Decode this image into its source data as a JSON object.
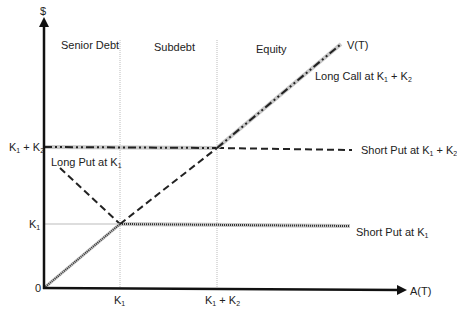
{
  "axes": {
    "y_label": "$",
    "x_label": "A(T)",
    "origin_label": "0",
    "x_ticks": [
      {
        "base": "K",
        "sub": "1",
        "rest": ""
      },
      {
        "base": "K",
        "sub": "1",
        "rest": " + K",
        "sub2": "2"
      }
    ],
    "y_ticks": [
      {
        "base": "K",
        "sub": "1"
      },
      {
        "base": "K",
        "sub": "1",
        "rest": " + K",
        "sub2": "2"
      }
    ]
  },
  "regions": {
    "senior_debt": "Senior Debt",
    "subdebt": "Subdebt",
    "equity": "Equity"
  },
  "lines": {
    "value_line": "V(T)",
    "long_call": {
      "text": "Long Call at K",
      "sub": "1",
      "rest": " + K",
      "sub2": "2"
    },
    "short_put_k1k2": {
      "text": "Short Put at K",
      "sub": "1",
      "rest": " + K",
      "sub2": "2"
    },
    "long_put": {
      "text": "Long Put at K",
      "sub": "1"
    },
    "short_put_k1": {
      "text": "Short Put at K",
      "sub": "1"
    }
  },
  "colors": {
    "axis": "#111111",
    "guide": "#bbbbbb",
    "highlight": "#c8c8c8",
    "dash": "#222222"
  }
}
